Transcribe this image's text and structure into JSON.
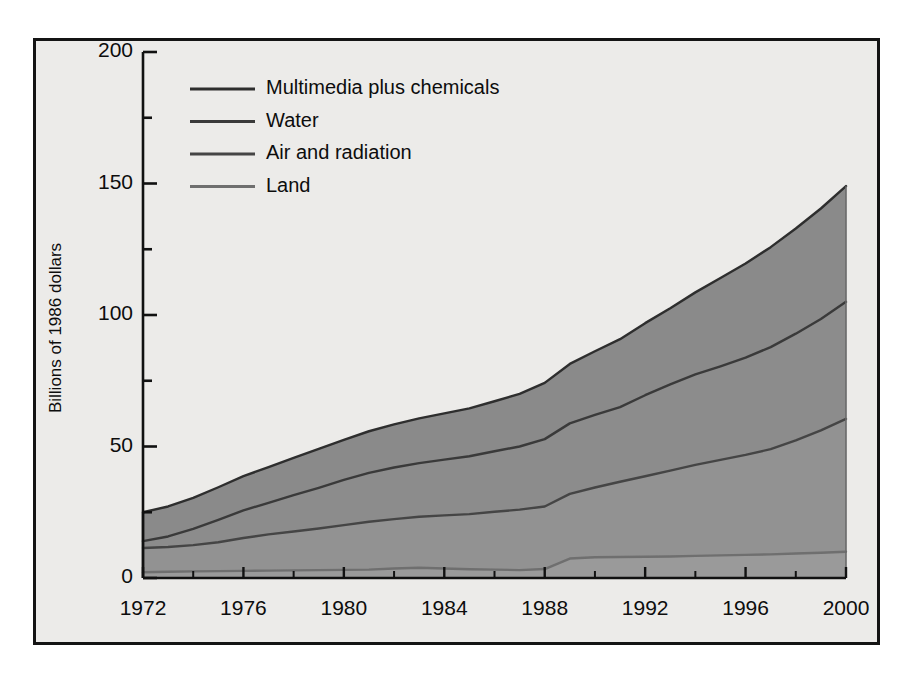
{
  "chart_data": {
    "type": "area",
    "stacked": true,
    "title": "",
    "subtitle": "",
    "xlabel": "",
    "ylabel": "Billions of 1986 dollars",
    "xlim": [
      1972,
      2000
    ],
    "ylim": [
      0,
      200
    ],
    "grid": false,
    "legend_position": "top-left",
    "x": [
      1972,
      1973,
      1974,
      1975,
      1976,
      1977,
      1978,
      1979,
      1980,
      1981,
      1982,
      1983,
      1984,
      1985,
      1986,
      1987,
      1988,
      1989,
      1990,
      1991,
      1992,
      1993,
      1994,
      1995,
      1996,
      1997,
      1998,
      1999,
      2000
    ],
    "x_ticks": [
      1972,
      1976,
      1980,
      1984,
      1988,
      1992,
      1996,
      2000
    ],
    "x_tick_labels": [
      "1972",
      "1976",
      "1980",
      "1984",
      "1988",
      "1992",
      "1996",
      "2000"
    ],
    "x_minor_tick_interval": 2,
    "y_ticks": [
      0,
      50,
      100,
      150,
      200
    ],
    "y_tick_labels": [
      "0",
      "50",
      "100",
      "150",
      "200"
    ],
    "y_minor_ticks": [
      25,
      75,
      125,
      175
    ],
    "series": [
      {
        "name": "Land",
        "order_from_bottom": 1,
        "fill_color": "#9a9a9a",
        "line_color": "#6f6f6f",
        "values": [
          2.2,
          2.4,
          2.5,
          2.6,
          2.7,
          2.8,
          2.9,
          3.0,
          3.1,
          3.2,
          3.6,
          3.9,
          3.6,
          3.3,
          3.2,
          3.0,
          3.4,
          7.4,
          7.9,
          8.0,
          8.1,
          8.2,
          8.4,
          8.6,
          8.8,
          9.0,
          9.3,
          9.6,
          10.0
        ]
      },
      {
        "name": "Air and radiation",
        "order_from_bottom": 2,
        "fill_color": "#929292",
        "line_color": "#454545",
        "values": [
          9.2,
          9.4,
          10.0,
          11.0,
          12.5,
          13.8,
          14.8,
          15.8,
          17.0,
          18.2,
          18.8,
          19.4,
          20.2,
          21.0,
          22.0,
          23.0,
          23.8,
          24.6,
          26.5,
          28.6,
          30.6,
          32.6,
          34.6,
          36.3,
          38.0,
          40.0,
          43.0,
          46.5,
          50.5
        ]
      },
      {
        "name": "Water",
        "order_from_bottom": 3,
        "fill_color": "#8c8c8c",
        "line_color": "#3a3a3a",
        "values": [
          2.6,
          4.0,
          6.2,
          8.5,
          10.5,
          12.0,
          13.8,
          15.5,
          17.2,
          18.6,
          19.6,
          20.4,
          21.2,
          22.0,
          23.0,
          24.0,
          25.6,
          26.8,
          27.6,
          28.4,
          30.8,
          32.8,
          34.4,
          35.6,
          37.0,
          38.8,
          40.6,
          42.4,
          44.5
        ]
      },
      {
        "name": "Multimedia plus chemicals",
        "order_from_bottom": 4,
        "fill_color": "#8a8a8a",
        "line_color": "#2e2e2e",
        "values": [
          11.0,
          11.4,
          11.8,
          12.4,
          13.0,
          13.6,
          14.2,
          14.8,
          15.2,
          15.8,
          16.4,
          17.0,
          17.6,
          18.2,
          19.0,
          20.0,
          21.4,
          22.6,
          24.2,
          25.8,
          27.4,
          29.0,
          31.2,
          33.6,
          35.8,
          38.0,
          40.0,
          42.0,
          44.0
        ]
      }
    ],
    "cumulative_totals_note": "Top boundary of stack at 2000 is approximately 149",
    "legend_entries": [
      {
        "label": "Multimedia plus chemicals",
        "swatch_color": "#2e2e2e"
      },
      {
        "label": "Water",
        "swatch_color": "#3a3a3a"
      },
      {
        "label": "Air and radiation",
        "swatch_color": "#454545"
      },
      {
        "label": "Land",
        "swatch_color": "#6f6f6f"
      }
    ]
  },
  "figure": {
    "background_color": "#ecebe9",
    "frame_color": "#141414",
    "text_color": "#0d0d0d"
  }
}
